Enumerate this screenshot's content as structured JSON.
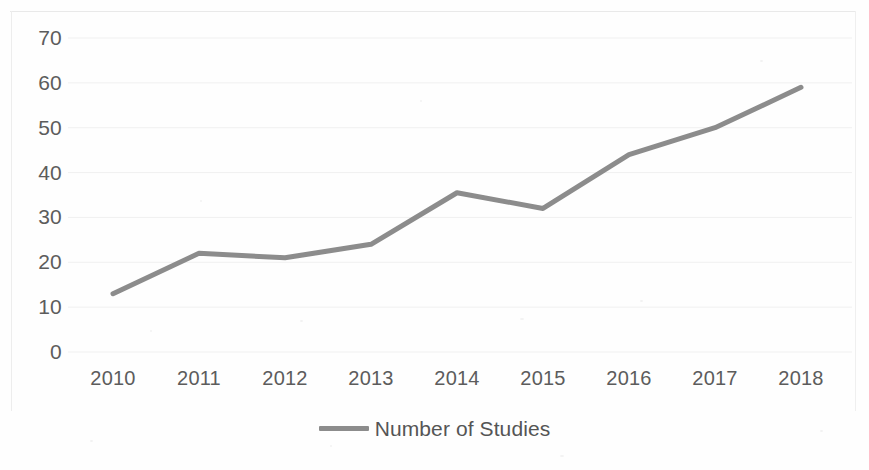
{
  "chart_data": {
    "type": "line",
    "title": "",
    "xlabel": "",
    "ylabel": "",
    "categories": [
      "2010",
      "2011",
      "2012",
      "2013",
      "2014",
      "2015",
      "2016",
      "2017",
      "2018"
    ],
    "series": [
      {
        "name": "Number of Studies",
        "color": "#8c8c8c",
        "values": [
          13,
          22,
          21,
          24,
          35.5,
          32,
          44,
          50,
          59
        ]
      }
    ],
    "ylim": [
      0,
      70
    ],
    "y_ticks": [
      "0",
      "10",
      "20",
      "30",
      "40",
      "50",
      "60",
      "70"
    ],
    "y_tick_values": [
      0,
      10,
      20,
      30,
      40,
      50,
      60,
      70
    ],
    "grid": true,
    "grid_color": "#f0f0f0",
    "legend_position": "bottom",
    "legend": [
      "Number of Studies"
    ],
    "markers": false
  },
  "legend": {
    "label": "Number of Studies"
  },
  "axes": {
    "y_labels": [
      "70",
      "60",
      "50",
      "40",
      "30",
      "20",
      "10",
      "0"
    ],
    "x_labels": [
      "2010",
      "2011",
      "2012",
      "2013",
      "2014",
      "2015",
      "2016",
      "2017",
      "2018"
    ]
  }
}
